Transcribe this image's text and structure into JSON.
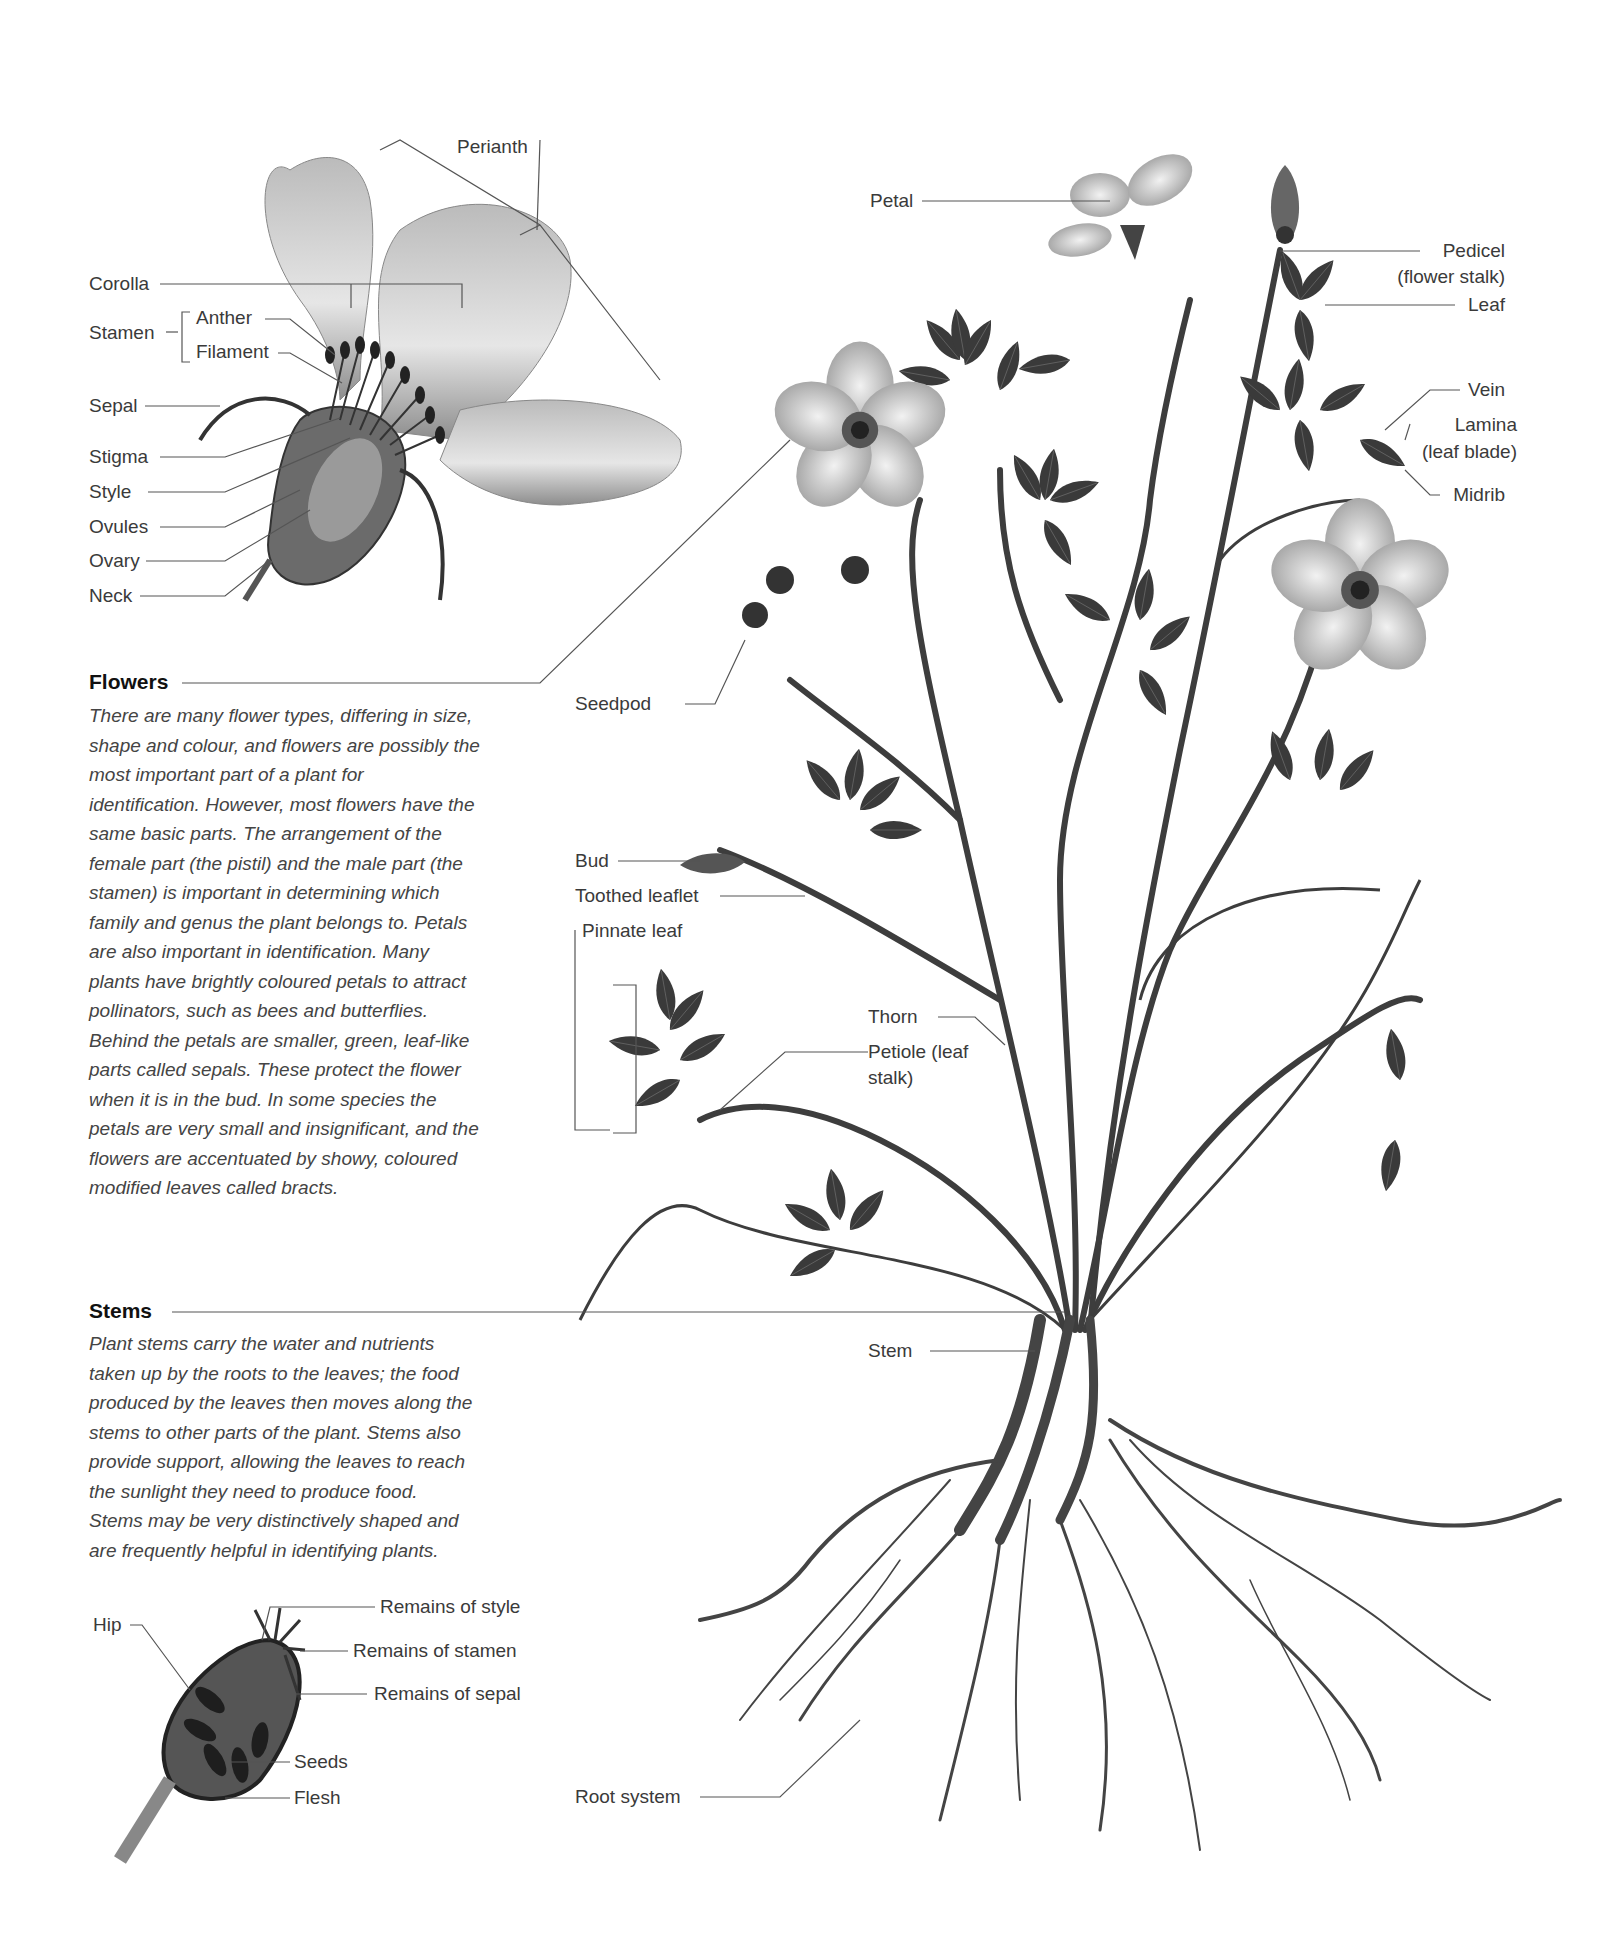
{
  "flower_detail": {
    "labels": {
      "perianth": "Perianth",
      "corolla": "Corolla",
      "stamen": "Stamen",
      "anther": "Anther",
      "filament": "Filament",
      "sepal": "Sepal",
      "stigma": "Stigma",
      "style": "Style",
      "ovules": "Ovules",
      "ovary": "Ovary",
      "neck": "Neck"
    }
  },
  "sections": {
    "flowers": {
      "heading": "Flowers",
      "lines": [
        "There are many flower types, differing in size,",
        "shape and colour, and flowers are possibly the",
        "most important part of a plant for",
        "identification. However, most flowers have the",
        "same basic parts. The arrangement of the",
        "female part (the pistil) and the male part (the",
        "stamen) is important in determining which",
        "family and genus the plant belongs to. Petals",
        "are also important in identification. Many",
        "plants have brightly coloured petals to attract",
        "pollinators, such as bees and butterflies.",
        "Behind the petals are smaller, green, leaf-like",
        "parts called sepals. These protect the flower",
        "when it is in the bud. In some species the",
        "petals are very small and insignificant, and the",
        "flowers are accentuated by showy, coloured",
        "modified leaves called bracts."
      ]
    },
    "stems": {
      "heading": "Stems",
      "lines": [
        "Plant stems carry the water and nutrients",
        "taken up by the roots to the leaves; the food",
        "produced by the leaves then moves along the",
        "stems to other parts of the plant. Stems also",
        "provide support, allowing the leaves to reach",
        "the sunlight they need to produce food.",
        "Stems may be very distinctively shaped and",
        "are frequently helpful in identifying plants."
      ]
    }
  },
  "hip_detail": {
    "labels": {
      "hip": "Hip",
      "remains_style": "Remains of style",
      "remains_stamen": "Remains of stamen",
      "remains_sepal": "Remains of sepal",
      "seeds": "Seeds",
      "flesh": "Flesh"
    }
  },
  "plant": {
    "labels": {
      "petal": "Petal",
      "pedicel": "Pedicel",
      "pedicel_sub": "(flower stalk)",
      "leaf": "Leaf",
      "vein": "Vein",
      "lamina": "Lamina",
      "lamina_sub": "(leaf blade)",
      "midrib": "Midrib",
      "seedpod": "Seedpod",
      "bud": "Bud",
      "toothed_leaflet": "Toothed leaflet",
      "pinnate_leaf": "Pinnate leaf",
      "thorn": "Thorn",
      "petiole": "Petiole (leaf",
      "petiole_sub": "stalk)",
      "stem": "Stem",
      "root_system": "Root system"
    }
  }
}
